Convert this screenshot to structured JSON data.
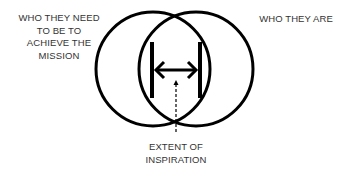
{
  "diagram": {
    "type": "venn",
    "circles": [
      {
        "name": "left",
        "label": "WHO THEY NEED TO BE TO ACHIEVE THE MISSION"
      },
      {
        "name": "right",
        "label": "WHO THEY ARE"
      }
    ],
    "labels": {
      "left_lines": [
        "WHO THEY NEED",
        "TO BE TO",
        "ACHIEVE THE",
        "MISSION"
      ],
      "right": "WHO THEY ARE",
      "bottom_lines": [
        "EXTENT OF",
        "INSPIRATION"
      ]
    },
    "colors": {
      "stroke": "#000000",
      "text": "#333333",
      "background": "#ffffff"
    }
  }
}
